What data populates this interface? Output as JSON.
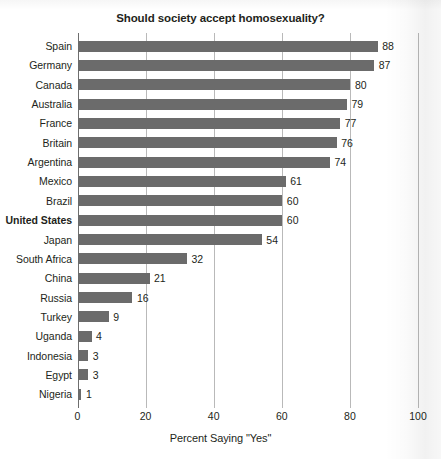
{
  "chart_data": {
    "type": "bar",
    "orientation": "horizontal",
    "title": "Should society accept homosexuality?",
    "xlabel": "Percent Saying \"Yes\"",
    "ylabel": "",
    "xlim": [
      0,
      100
    ],
    "xticks": [
      0,
      20,
      40,
      60,
      80,
      100
    ],
    "xtick_labels": [
      "0",
      "20",
      "40",
      "60",
      "80",
      "100"
    ],
    "grid": "vertical",
    "legend": "none",
    "bar_color": "#6b6b6b",
    "gridline_color": "#b9b9b9",
    "axis_color": "#6e6e6e",
    "categories": [
      "Spain",
      "Germany",
      "Canada",
      "Australia",
      "France",
      "Britain",
      "Argentina",
      "Mexico",
      "Brazil",
      "United States",
      "Japan",
      "South Africa",
      "China",
      "Russia",
      "Turkey",
      "Uganda",
      "Indonesia",
      "Egypt",
      "Nigeria"
    ],
    "values": [
      88,
      87,
      80,
      79,
      77,
      76,
      74,
      61,
      60,
      60,
      54,
      32,
      21,
      16,
      9,
      4,
      3,
      3,
      1
    ],
    "highlighted": [
      "United States"
    ],
    "rows": [
      {
        "label": "Spain",
        "value": 88,
        "value_label": "88",
        "bold": false
      },
      {
        "label": "Germany",
        "value": 87,
        "value_label": "87",
        "bold": false
      },
      {
        "label": "Canada",
        "value": 80,
        "value_label": "80",
        "bold": false
      },
      {
        "label": "Australia",
        "value": 79,
        "value_label": "79",
        "bold": false
      },
      {
        "label": "France",
        "value": 77,
        "value_label": "77",
        "bold": false
      },
      {
        "label": "Britain",
        "value": 76,
        "value_label": "76",
        "bold": false
      },
      {
        "label": "Argentina",
        "value": 74,
        "value_label": "74",
        "bold": false
      },
      {
        "label": "Mexico",
        "value": 61,
        "value_label": "61",
        "bold": false
      },
      {
        "label": "Brazil",
        "value": 60,
        "value_label": "60",
        "bold": false
      },
      {
        "label": "United States",
        "value": 60,
        "value_label": "60",
        "bold": true
      },
      {
        "label": "Japan",
        "value": 54,
        "value_label": "54",
        "bold": false
      },
      {
        "label": "South Africa",
        "value": 32,
        "value_label": "32",
        "bold": false
      },
      {
        "label": "China",
        "value": 21,
        "value_label": "21",
        "bold": false
      },
      {
        "label": "Russia",
        "value": 16,
        "value_label": "16",
        "bold": false
      },
      {
        "label": "Turkey",
        "value": 9,
        "value_label": "9",
        "bold": false
      },
      {
        "label": "Uganda",
        "value": 4,
        "value_label": "4",
        "bold": false
      },
      {
        "label": "Indonesia",
        "value": 3,
        "value_label": "3",
        "bold": false
      },
      {
        "label": "Egypt",
        "value": 3,
        "value_label": "3",
        "bold": false
      },
      {
        "label": "Nigeria",
        "value": 1,
        "value_label": "1",
        "bold": false
      }
    ]
  }
}
